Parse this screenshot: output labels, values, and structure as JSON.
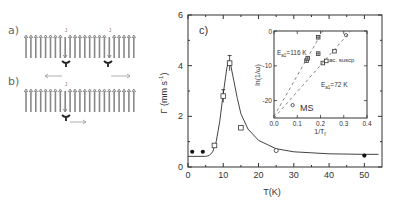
{
  "schematic": {
    "panel_a_label": "a)",
    "panel_b_label": "b)",
    "defect_label": "J",
    "spin_color": "#888888",
    "arrow_color": "#999999",
    "row_a": {
      "count": 23,
      "down_indices": [
        8,
        17
      ]
    },
    "row_b": {
      "count": 23,
      "down_indices": [
        8
      ]
    }
  },
  "chart_data": [
    {
      "type": "scatter",
      "panel_label": "c)",
      "title": "",
      "xlabel": "T(K)",
      "ylabel": "Γ (mm s⁻¹)",
      "xlim": [
        0,
        55
      ],
      "ylim": [
        0,
        6
      ],
      "xticks": [
        0,
        10,
        20,
        30,
        40,
        50
      ],
      "yticks": [
        0,
        2,
        4,
        6
      ],
      "grid": false,
      "series": [
        {
          "name": "filled circles",
          "marker": "filled-circle",
          "x": [
            1.2,
            4.2,
            50
          ],
          "y": [
            0.6,
            0.6,
            0.45
          ]
        },
        {
          "name": "open squares",
          "marker": "open-square",
          "x": [
            7.5,
            10,
            11.8,
            15
          ],
          "y": [
            0.85,
            2.8,
            4.1,
            1.55
          ],
          "yerr": [
            0,
            0.25,
            0.3,
            0
          ]
        },
        {
          "name": "open circle",
          "marker": "open-circle",
          "x": [
            25
          ],
          "y": [
            0.65
          ]
        },
        {
          "name": "fit",
          "marker": "line",
          "x": [
            0,
            5,
            6,
            7,
            8,
            9,
            10,
            11,
            11.5,
            12,
            13,
            14,
            15,
            17,
            20,
            25,
            30,
            40,
            50,
            54
          ],
          "y": [
            0.42,
            0.42,
            0.45,
            0.6,
            1.0,
            1.8,
            2.9,
            3.9,
            4.2,
            4.1,
            3.4,
            2.7,
            2.1,
            1.5,
            1.05,
            0.72,
            0.6,
            0.52,
            0.5,
            0.5
          ]
        }
      ]
    },
    {
      "type": "scatter",
      "title": "",
      "inset": true,
      "xlabel": "1/T_f",
      "ylabel": "ln(1/ω)",
      "xlim": [
        0.0,
        0.4
      ],
      "ylim": [
        -25,
        0
      ],
      "xticks": [
        0.0,
        0.1,
        0.2,
        0.3,
        0.4
      ],
      "yticks": [
        0,
        -10,
        -20
      ],
      "annotations": [
        "E_a1=116 K",
        "E_a1=72 K",
        "ac. suscp",
        "MS"
      ],
      "series": [
        {
          "name": "ac. suscp (116 K)",
          "marker": "hash",
          "x": [
            0.14,
            0.145,
            0.19,
            0.19
          ],
          "y": [
            -8.5,
            -7.8,
            -6.5,
            -1.8
          ]
        },
        {
          "name": "ac. suscp (72 K)",
          "marker": "open-square",
          "x": [
            0.21,
            0.225,
            0.26
          ],
          "y": [
            -9.2,
            -8.6,
            -5.8
          ]
        },
        {
          "name": "open circles",
          "marker": "open-circle",
          "x": [
            0.31,
            0.08
          ],
          "y": [
            -1.2,
            -21.3
          ]
        },
        {
          "name": "fit 116 K",
          "marker": "dashed-line",
          "x": [
            0.0,
            0.21
          ],
          "y": [
            -24.5,
            0
          ]
        },
        {
          "name": "fit 72 K",
          "marker": "dashed-line",
          "x": [
            0.0,
            0.33
          ],
          "y": [
            -25,
            0
          ]
        }
      ]
    }
  ],
  "labels": {
    "main_panel": "c)",
    "main_xlabel": "T(K)",
    "main_ylabel_base": "Γ (mm s",
    "main_ylabel_sup": "-1",
    "main_ylabel_end": ")",
    "inset_ylabel": "ln(1/ω)",
    "inset_xlabel": "1/T",
    "inset_xlabel_sub": "f",
    "ann_116": "E",
    "ann_116_sub": "a1",
    "ann_116_val": "=116 K",
    "ann_72": "E",
    "ann_72_sub": "a1",
    "ann_72_val": "=72 K",
    "ann_ac": "ac. suscp",
    "ann_ms": "MS"
  }
}
